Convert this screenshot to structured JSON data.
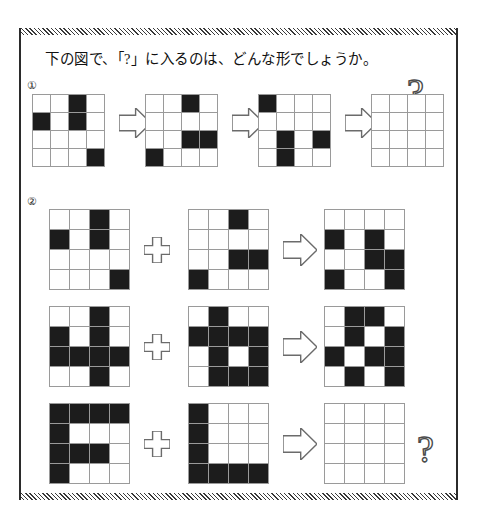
{
  "page": {
    "title": "下の図で、「?」に入るのは、どんな形でしょうか。",
    "question_glyph": "?",
    "plus_glyph": "+",
    "arrow_glyph": "→"
  },
  "sections": [
    {
      "number": "①",
      "operation": "sequence",
      "rows": [
        {
          "grids": [
            {
              "name": "sequence-step-1",
              "rows": 4,
              "cols": 4,
              "filled": [
                [
                  0,
                  2
                ],
                [
                  1,
                  0
                ],
                [
                  1,
                  2
                ],
                [
                  3,
                  3
                ]
              ]
            },
            {
              "name": "sequence-step-2",
              "rows": 4,
              "cols": 4,
              "filled": [
                [
                  0,
                  2
                ],
                [
                  2,
                  2
                ],
                [
                  2,
                  3
                ],
                [
                  3,
                  0
                ]
              ]
            },
            {
              "name": "sequence-step-3",
              "rows": 4,
              "cols": 4,
              "filled": [
                [
                  0,
                  0
                ],
                [
                  2,
                  1
                ],
                [
                  2,
                  3
                ],
                [
                  3,
                  1
                ]
              ]
            },
            {
              "name": "sequence-answer",
              "rows": 4,
              "cols": 4,
              "filled": []
            }
          ]
        }
      ]
    },
    {
      "number": "②",
      "operation": "xor-addition",
      "rows": [
        {
          "name": "xor-row-1",
          "operand_a": {
            "rows": 4,
            "cols": 4,
            "filled": [
              [
                0,
                2
              ],
              [
                1,
                0
              ],
              [
                1,
                2
              ],
              [
                3,
                3
              ]
            ]
          },
          "operand_b": {
            "rows": 4,
            "cols": 4,
            "filled": [
              [
                0,
                2
              ],
              [
                2,
                2
              ],
              [
                2,
                3
              ],
              [
                3,
                0
              ]
            ]
          },
          "result": {
            "rows": 4,
            "cols": 4,
            "filled": [
              [
                1,
                0
              ],
              [
                1,
                2
              ],
              [
                2,
                2
              ],
              [
                2,
                3
              ],
              [
                3,
                0
              ],
              [
                3,
                3
              ]
            ]
          },
          "has_question": false
        },
        {
          "name": "xor-row-2",
          "operand_a": {
            "rows": 4,
            "cols": 4,
            "filled": [
              [
                0,
                2
              ],
              [
                1,
                0
              ],
              [
                1,
                2
              ],
              [
                2,
                0
              ],
              [
                2,
                1
              ],
              [
                2,
                2
              ],
              [
                2,
                3
              ],
              [
                3,
                2
              ]
            ]
          },
          "operand_b": {
            "rows": 4,
            "cols": 4,
            "filled": [
              [
                0,
                1
              ],
              [
                1,
                0
              ],
              [
                1,
                1
              ],
              [
                1,
                2
              ],
              [
                1,
                3
              ],
              [
                2,
                1
              ],
              [
                2,
                3
              ],
              [
                3,
                1
              ],
              [
                3,
                2
              ],
              [
                3,
                3
              ]
            ]
          },
          "result": {
            "rows": 4,
            "cols": 4,
            "filled": [
              [
                0,
                1
              ],
              [
                0,
                2
              ],
              [
                1,
                1
              ],
              [
                1,
                3
              ],
              [
                2,
                0
              ],
              [
                2,
                2
              ],
              [
                2,
                3
              ],
              [
                3,
                1
              ],
              [
                3,
                3
              ]
            ]
          },
          "has_question": false
        },
        {
          "name": "xor-row-3",
          "operand_a": {
            "rows": 4,
            "cols": 4,
            "filled": [
              [
                0,
                0
              ],
              [
                0,
                1
              ],
              [
                0,
                2
              ],
              [
                0,
                3
              ],
              [
                1,
                0
              ],
              [
                2,
                0
              ],
              [
                2,
                1
              ],
              [
                2,
                2
              ],
              [
                3,
                0
              ]
            ]
          },
          "operand_b": {
            "rows": 4,
            "cols": 4,
            "filled": [
              [
                0,
                0
              ],
              [
                1,
                0
              ],
              [
                2,
                0
              ],
              [
                3,
                0
              ],
              [
                3,
                1
              ],
              [
                3,
                2
              ],
              [
                3,
                3
              ]
            ]
          },
          "result": {
            "rows": 4,
            "cols": 4,
            "filled": []
          },
          "has_question": true
        }
      ]
    }
  ],
  "colors": {
    "filled_cell": "#1c1c1c",
    "empty_cell": "#ffffff",
    "grid_line": "#9a9a9a",
    "outline": "#6b6b6b",
    "frame": "#2b2b2b",
    "text": "#111111"
  }
}
